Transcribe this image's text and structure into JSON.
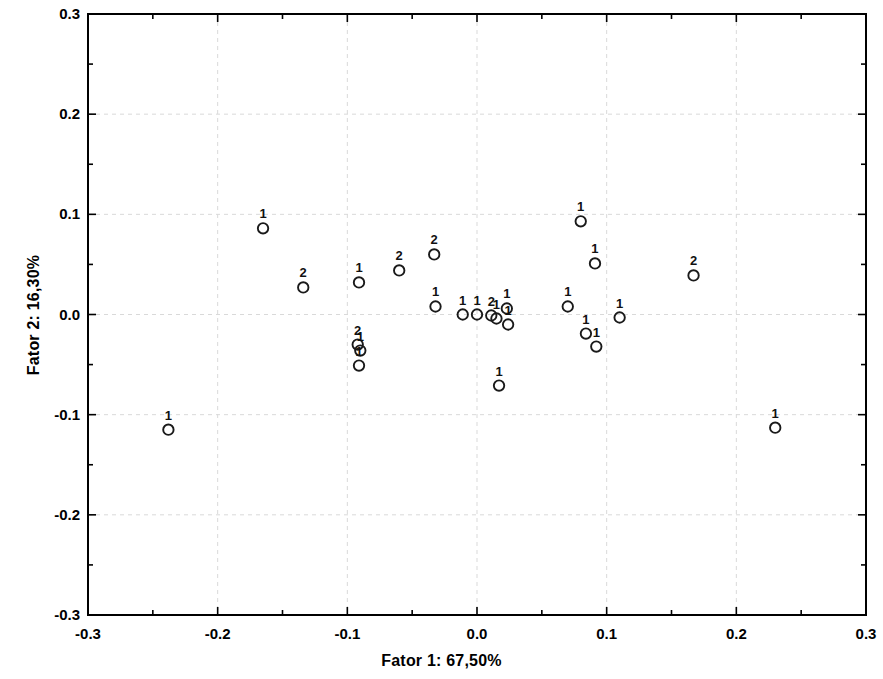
{
  "chart_data": {
    "type": "scatter",
    "title": "",
    "xlabel": "Fator 1: 67,50%",
    "ylabel": "Fator 2: 16,30%",
    "xlim": [
      -0.3,
      0.3
    ],
    "ylim": [
      -0.3,
      0.3
    ],
    "xticks": [
      "-0.3",
      "-0.2",
      "-0.1",
      "0.0",
      "0.1",
      "0.2",
      "0.3"
    ],
    "xtick_values": [
      -0.3,
      -0.2,
      -0.1,
      0.0,
      0.1,
      0.2,
      0.3
    ],
    "yticks": [
      "-0.3",
      "-0.2",
      "-0.1",
      "0.0",
      "0.1",
      "0.2",
      "0.3"
    ],
    "ytick_values": [
      -0.3,
      -0.2,
      -0.1,
      0.0,
      0.1,
      0.2,
      0.3
    ],
    "grid": true,
    "grid_color": "#d9d9d9",
    "legend": "none",
    "marker": "open-circle",
    "marker_color": "#1a1a1a",
    "marker_fill": "none",
    "point_label_position": "above",
    "points": [
      {
        "x": -0.238,
        "y": -0.115,
        "label": "1"
      },
      {
        "x": -0.165,
        "y": 0.086,
        "label": "1"
      },
      {
        "x": -0.134,
        "y": 0.027,
        "label": "2"
      },
      {
        "x": -0.091,
        "y": 0.032,
        "label": "1"
      },
      {
        "x": -0.092,
        "y": -0.03,
        "label": "2"
      },
      {
        "x": -0.09,
        "y": -0.036,
        "label": "1"
      },
      {
        "x": -0.091,
        "y": -0.051,
        "label": "1"
      },
      {
        "x": -0.06,
        "y": 0.044,
        "label": "2"
      },
      {
        "x": -0.033,
        "y": 0.06,
        "label": "2"
      },
      {
        "x": -0.032,
        "y": 0.008,
        "label": "1"
      },
      {
        "x": -0.011,
        "y": 0.0,
        "label": "1"
      },
      {
        "x": 0.0,
        "y": 0.0,
        "label": "1"
      },
      {
        "x": 0.011,
        "y": -0.001,
        "label": "2"
      },
      {
        "x": 0.015,
        "y": -0.004,
        "label": "1"
      },
      {
        "x": 0.023,
        "y": 0.006,
        "label": "1"
      },
      {
        "x": 0.024,
        "y": -0.01,
        "label": "1"
      },
      {
        "x": 0.017,
        "y": -0.071,
        "label": "1"
      },
      {
        "x": 0.07,
        "y": 0.008,
        "label": "1"
      },
      {
        "x": 0.08,
        "y": 0.093,
        "label": "1"
      },
      {
        "x": 0.091,
        "y": 0.051,
        "label": "1"
      },
      {
        "x": 0.084,
        "y": -0.019,
        "label": "1"
      },
      {
        "x": 0.092,
        "y": -0.032,
        "label": "1"
      },
      {
        "x": 0.11,
        "y": -0.003,
        "label": "1"
      },
      {
        "x": 0.167,
        "y": 0.039,
        "label": "2"
      },
      {
        "x": 0.23,
        "y": -0.113,
        "label": "1"
      }
    ],
    "axes_geometry": {
      "left_px": 88,
      "right_px": 866,
      "top_px": 14,
      "bottom_px": 615
    }
  }
}
